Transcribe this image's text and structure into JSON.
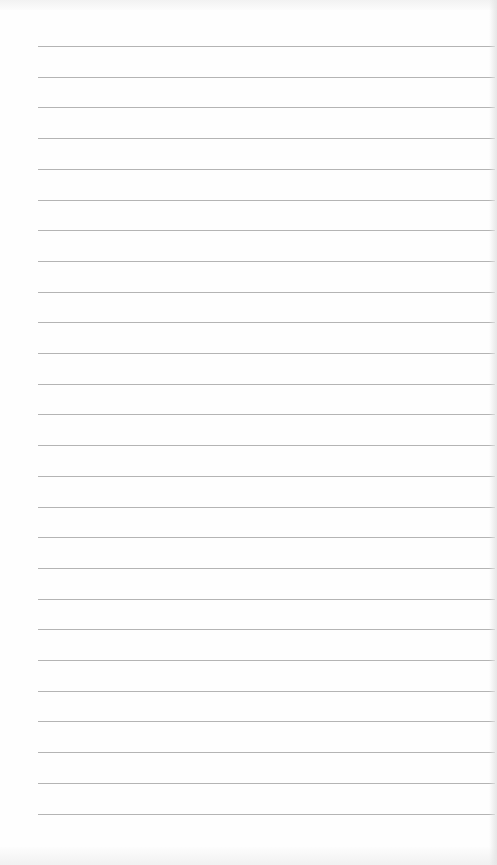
{
  "page": {
    "type": "lined-paper",
    "line_color": "#b4b4b4",
    "background_color": "#fefefe",
    "line_count": 26,
    "first_line_y": 46,
    "line_spacing": 30.7,
    "line_left": 38,
    "line_width": 457
  }
}
